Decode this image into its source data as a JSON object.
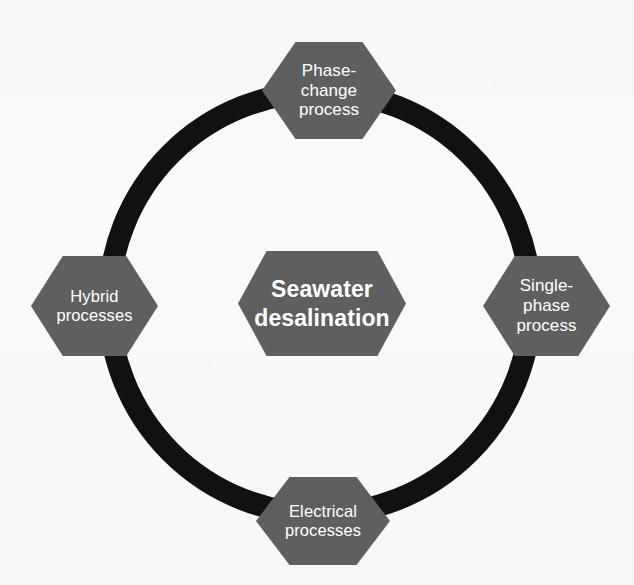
{
  "figure": {
    "type": "cycle-diagram",
    "background_color": "#fbfaf8",
    "ring_color": "#111111",
    "node_fill_color": "#5f5f5f",
    "node_text_color": "#ffffff",
    "center": {
      "id": "seawater-desalination",
      "label": "Seawater\ndesalination",
      "emphasis": "bold"
    },
    "nodes": [
      {
        "id": "phase-change-process",
        "position": "top",
        "label": "Phase-\nchange\nprocess"
      },
      {
        "id": "single-phase-process",
        "position": "right",
        "label": "Single-\nphase\nprocess"
      },
      {
        "id": "electrical-processes",
        "position": "bottom",
        "label": "Electrical\nprocesses"
      },
      {
        "id": "hybrid-processes",
        "position": "left",
        "label": "Hybrid\nprocesses"
      }
    ]
  }
}
